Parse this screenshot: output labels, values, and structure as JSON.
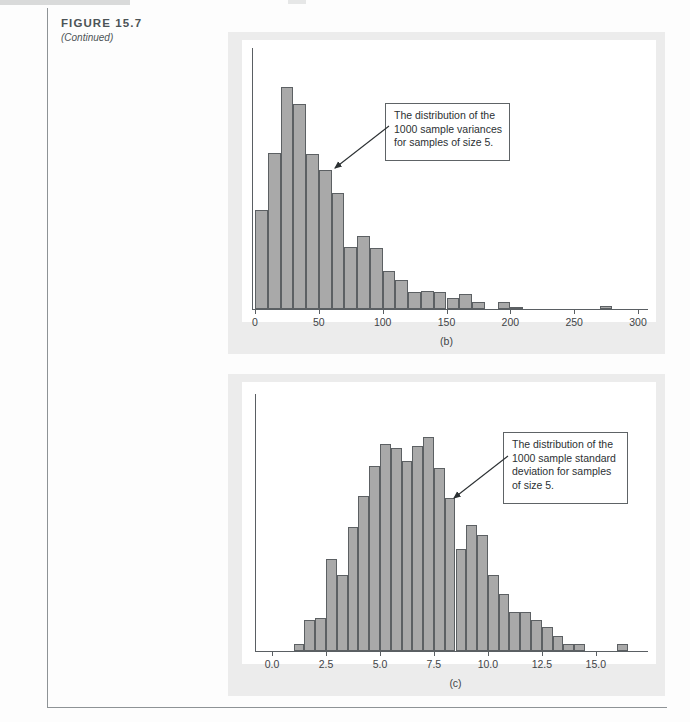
{
  "figure": {
    "title": "FIGURE 15.7",
    "subtitle": "(Continued)"
  },
  "panels": [
    {
      "key": "b",
      "label": "(b)",
      "callout": "The distribution of the 1000 sample variances for samples of size 5.",
      "callout_lines": [
        "The distribution of the",
        "1000 sample variances",
        "for samples of size 5."
      ]
    },
    {
      "key": "c",
      "label": "(c)",
      "callout": "The distribution of the 1000 sample standard deviation for samples of size 5.",
      "callout_lines": [
        "The distribution of the",
        "1000 sample standard",
        "deviation for samples",
        "of size 5."
      ]
    }
  ],
  "chart_data": [
    {
      "type": "bar",
      "id": "panel-b",
      "title": "(b)",
      "subtitle": "The distribution of the 1000 sample variances for samples of size 5.",
      "xlabel": "",
      "ylabel": "",
      "xlim": [
        0,
        300
      ],
      "ylim": [
        0,
        168
      ],
      "xticks": [
        0,
        50,
        100,
        150,
        200,
        250,
        300
      ],
      "xticklabels": [
        "0",
        "50",
        "100",
        "150",
        "200",
        "250",
        "300"
      ],
      "grid": false,
      "legend": null,
      "bin_width": 10,
      "bin_starts": [
        0,
        10,
        20,
        30,
        40,
        50,
        60,
        70,
        80,
        90,
        100,
        110,
        120,
        130,
        140,
        150,
        160,
        170,
        180,
        190,
        200,
        210,
        220,
        230,
        240,
        250,
        260,
        270,
        280,
        290
      ],
      "values": [
        75,
        118,
        168,
        155,
        117,
        105,
        88,
        47,
        55,
        46,
        29,
        22,
        13,
        14,
        13,
        8,
        11,
        5,
        0,
        5,
        1,
        0,
        0,
        0,
        0,
        0,
        0,
        2,
        0,
        0
      ]
    },
    {
      "type": "bar",
      "id": "panel-c",
      "title": "(c)",
      "subtitle": "The distribution of the 1000 sample standard deviation for samples of size 5.",
      "xlabel": "",
      "ylabel": "",
      "xlim": [
        0.0,
        17.0
      ],
      "ylim": [
        0,
        100
      ],
      "xticks": [
        0.0,
        2.5,
        5.0,
        7.5,
        10.0,
        12.5,
        15.0
      ],
      "xticklabels": [
        "0.0",
        "2.5",
        "5.0",
        "7.5",
        "10.0",
        "12.5",
        "15.0"
      ],
      "grid": false,
      "legend": null,
      "bin_width": 0.5,
      "bin_starts": [
        1.0,
        1.5,
        2.0,
        2.5,
        3.0,
        3.5,
        4.0,
        4.5,
        5.0,
        5.5,
        6.0,
        6.5,
        7.0,
        7.5,
        8.0,
        8.5,
        9.0,
        9.5,
        10.0,
        10.5,
        11.0,
        11.5,
        12.0,
        12.5,
        13.0,
        13.5,
        14.0,
        16.0
      ],
      "values": [
        3,
        14,
        15,
        42,
        35,
        57,
        71,
        85,
        95,
        93,
        87,
        94,
        98,
        84,
        70,
        47,
        58,
        53,
        35,
        26,
        18,
        18,
        14,
        11,
        7,
        3,
        3,
        3
      ]
    }
  ]
}
